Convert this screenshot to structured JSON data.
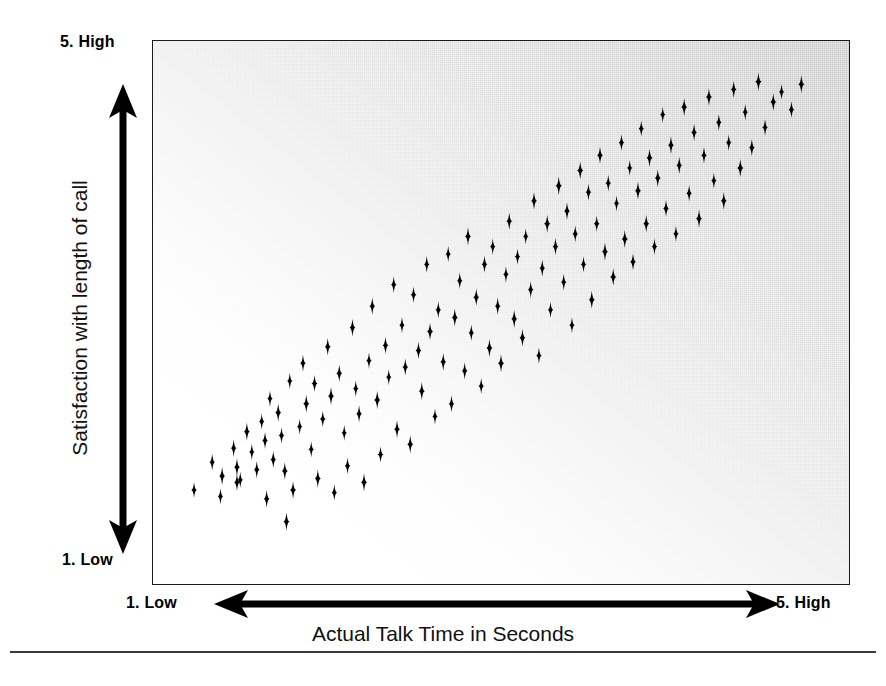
{
  "figure": {
    "axis_title_x": "Actual Talk Time in Seconds",
    "axis_title_y": "Satisfaction with length of call",
    "y_high_label": "5.  High",
    "y_low_label": "1.  Low",
    "x_low_label": "1.  Low",
    "x_high_label": "5.  High",
    "marker_color": "#000000",
    "frame_color": "#1a1a1a",
    "background_light": "#ffffff",
    "background_dark": "#c9c9c9"
  },
  "chart_data": {
    "type": "scatter",
    "title": "",
    "subtitle": "",
    "xlabel": "Actual Talk Time in Seconds",
    "ylabel": "Satisfaction with length of call",
    "xlim": [
      1,
      5
    ],
    "ylim": [
      1,
      5
    ],
    "x_tick_labels": [
      "1.  Low",
      "5.  High"
    ],
    "y_tick_labels": [
      "1.  Low",
      "5.  High"
    ],
    "grid": false,
    "legend": null,
    "marker": "four-pointed-star",
    "relationship": "positive correlation",
    "n_points": 131,
    "series": [
      {
        "name": "Calls",
        "points": [
          [
            1.14,
            1.6
          ],
          [
            1.25,
            1.82
          ],
          [
            1.31,
            1.71
          ],
          [
            1.3,
            1.55
          ],
          [
            1.38,
            1.93
          ],
          [
            1.4,
            1.78
          ],
          [
            1.42,
            1.68
          ],
          [
            1.4,
            1.66
          ],
          [
            1.46,
            2.06
          ],
          [
            1.49,
            1.9
          ],
          [
            1.52,
            1.76
          ],
          [
            1.55,
            2.14
          ],
          [
            1.57,
            1.99
          ],
          [
            1.58,
            1.53
          ],
          [
            1.6,
            2.32
          ],
          [
            1.62,
            1.84
          ],
          [
            1.65,
            2.21
          ],
          [
            1.67,
            2.03
          ],
          [
            1.69,
            1.75
          ],
          [
            1.7,
            1.35
          ],
          [
            1.72,
            2.46
          ],
          [
            1.74,
            1.6
          ],
          [
            1.78,
            2.1
          ],
          [
            1.8,
            2.6
          ],
          [
            1.82,
            2.28
          ],
          [
            1.85,
            1.92
          ],
          [
            1.87,
            2.44
          ],
          [
            1.89,
            1.69
          ],
          [
            1.92,
            2.16
          ],
          [
            1.95,
            2.73
          ],
          [
            1.97,
            2.34
          ],
          [
            1.99,
            1.58
          ],
          [
            2.02,
            2.52
          ],
          [
            2.05,
            2.05
          ],
          [
            2.07,
            1.79
          ],
          [
            2.1,
            2.88
          ],
          [
            2.12,
            2.4
          ],
          [
            2.14,
            2.2
          ],
          [
            2.17,
            1.66
          ],
          [
            2.2,
            2.62
          ],
          [
            2.22,
            3.05
          ],
          [
            2.25,
            2.31
          ],
          [
            2.27,
            1.88
          ],
          [
            2.3,
            2.74
          ],
          [
            2.32,
            2.49
          ],
          [
            2.35,
            3.22
          ],
          [
            2.37,
            2.08
          ],
          [
            2.4,
            2.9
          ],
          [
            2.42,
            2.57
          ],
          [
            2.45,
            1.96
          ],
          [
            2.47,
            3.14
          ],
          [
            2.5,
            2.7
          ],
          [
            2.52,
            2.38
          ],
          [
            2.55,
            3.38
          ],
          [
            2.57,
            2.85
          ],
          [
            2.6,
            2.18
          ],
          [
            2.62,
            3.02
          ],
          [
            2.65,
            2.61
          ],
          [
            2.68,
            3.46
          ],
          [
            2.7,
            2.28
          ],
          [
            2.72,
            2.96
          ],
          [
            2.75,
            3.25
          ],
          [
            2.78,
            2.54
          ],
          [
            2.8,
            3.6
          ],
          [
            2.82,
            2.84
          ],
          [
            2.85,
            3.12
          ],
          [
            2.88,
            2.42
          ],
          [
            2.9,
            3.38
          ],
          [
            2.93,
            2.72
          ],
          [
            2.95,
            3.52
          ],
          [
            2.98,
            3.05
          ],
          [
            3.0,
            2.6
          ],
          [
            3.03,
            3.3
          ],
          [
            3.05,
            3.72
          ],
          [
            3.08,
            2.95
          ],
          [
            3.1,
            3.44
          ],
          [
            3.13,
            2.8
          ],
          [
            3.15,
            3.6
          ],
          [
            3.18,
            3.18
          ],
          [
            3.2,
            3.88
          ],
          [
            3.23,
            2.66
          ],
          [
            3.25,
            3.35
          ],
          [
            3.28,
            3.7
          ],
          [
            3.3,
            3.02
          ],
          [
            3.33,
            3.52
          ],
          [
            3.35,
            4.0
          ],
          [
            3.38,
            3.24
          ],
          [
            3.4,
            3.8
          ],
          [
            3.43,
            2.9
          ],
          [
            3.45,
            3.62
          ],
          [
            3.48,
            4.12
          ],
          [
            3.5,
            3.38
          ],
          [
            3.53,
            3.95
          ],
          [
            3.55,
            3.1
          ],
          [
            3.58,
            3.7
          ],
          [
            3.6,
            4.24
          ],
          [
            3.63,
            3.48
          ],
          [
            3.65,
            4.02
          ],
          [
            3.68,
            3.28
          ],
          [
            3.7,
            3.86
          ],
          [
            3.73,
            4.34
          ],
          [
            3.75,
            3.58
          ],
          [
            3.78,
            4.14
          ],
          [
            3.8,
            3.4
          ],
          [
            3.83,
            3.96
          ],
          [
            3.85,
            4.45
          ],
          [
            3.88,
            3.7
          ],
          [
            3.9,
            4.22
          ],
          [
            3.93,
            3.52
          ],
          [
            3.95,
            4.06
          ],
          [
            3.98,
            4.56
          ],
          [
            4.0,
            3.82
          ],
          [
            4.03,
            4.32
          ],
          [
            4.06,
            3.62
          ],
          [
            4.08,
            4.16
          ],
          [
            4.11,
            4.62
          ],
          [
            4.14,
            3.94
          ],
          [
            4.17,
            4.42
          ],
          [
            4.2,
            3.74
          ],
          [
            4.23,
            4.24
          ],
          [
            4.26,
            4.7
          ],
          [
            4.29,
            4.04
          ],
          [
            4.32,
            4.5
          ],
          [
            4.35,
            3.88
          ],
          [
            4.38,
            4.34
          ],
          [
            4.41,
            4.76
          ],
          [
            4.45,
            4.14
          ],
          [
            4.48,
            4.58
          ],
          [
            4.52,
            4.3
          ],
          [
            4.56,
            4.82
          ],
          [
            4.6,
            4.46
          ],
          [
            4.65,
            4.66
          ],
          [
            4.7,
            4.74
          ],
          [
            4.76,
            4.6
          ],
          [
            4.82,
            4.8
          ]
        ]
      }
    ]
  }
}
